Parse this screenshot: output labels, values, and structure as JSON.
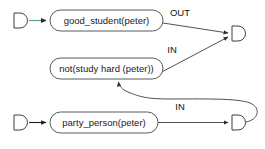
{
  "diagram": {
    "nodes": [
      {
        "id": "good_student",
        "label": "good_student(peter)",
        "shape": "rounded-rect"
      },
      {
        "id": "not_study_hard",
        "label": "not(study hard (peter))",
        "shape": "rounded-rect"
      },
      {
        "id": "party_person",
        "label": "party_person(peter)",
        "shape": "rounded-rect"
      }
    ],
    "ports": [
      {
        "id": "port-top-left",
        "shape": "d-shape"
      },
      {
        "id": "port-right-top",
        "shape": "d-shape"
      },
      {
        "id": "port-bottom-left",
        "shape": "d-shape"
      },
      {
        "id": "port-right-bottom",
        "shape": "d-shape"
      }
    ],
    "edges": [
      {
        "id": "edge-top-in",
        "label": "",
        "color": "#5f9e96"
      },
      {
        "id": "edge-good-student-out",
        "label": "OUT",
        "color": "#4d5353"
      },
      {
        "id": "edge-not-study-in",
        "label": "IN",
        "color": "#4d5353"
      },
      {
        "id": "edge-bottom-in",
        "label": "",
        "color": "#1d1f1f"
      },
      {
        "id": "edge-party-person-in",
        "label": "IN",
        "color": "#4d5353"
      },
      {
        "id": "edge-feedback",
        "label": "",
        "color": "#4d5353"
      }
    ]
  },
  "colors": {
    "background": "#ffffff",
    "node_stroke": "#555b5b",
    "edge": "#4d5353",
    "edge_dark": "#1d1f1f",
    "edge_teal": "#5f9e96",
    "text": "#1a1a1a"
  }
}
